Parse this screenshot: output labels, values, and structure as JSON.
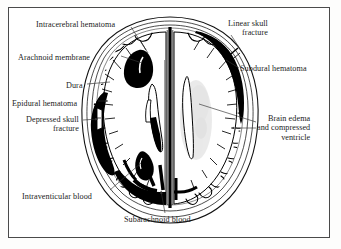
{
  "figure": {
    "frame_color": "#4a4a4a",
    "background_color": "#ffffff",
    "ink_color": "#000000",
    "text_color": "#232323",
    "edema_color": "#cfcfcf"
  },
  "labels": [
    {
      "id": "intracerebral-hematoma",
      "text": "Intracerebral hematoma",
      "align": "left",
      "x": 36,
      "y": 20
    },
    {
      "id": "arachnoid-membrane",
      "text": "Arachnoid membrane",
      "align": "left",
      "x": 18,
      "y": 53
    },
    {
      "id": "dura",
      "text": "Dura",
      "align": "left",
      "x": 66,
      "y": 81
    },
    {
      "id": "epidural-hematoma",
      "text": "Epidural hematoma",
      "align": "left",
      "x": 12,
      "y": 99
    },
    {
      "id": "depressed-skull-fracture",
      "text": "Depressed skull\nfracture",
      "align": "left",
      "x": 26,
      "y": 117
    },
    {
      "id": "intraventicular-blood",
      "text": "Intraventicular blood",
      "align": "left",
      "x": 22,
      "y": 192
    },
    {
      "id": "subarachnoid-blood",
      "text": "Subarachnoid blood",
      "align": "left",
      "x": 124,
      "y": 215
    },
    {
      "id": "linear-skull-fracture",
      "text": "Linear skull\nfracture",
      "align": "left",
      "x": 228,
      "y": 20
    },
    {
      "id": "subdural-hematoma",
      "text": "Subdural hematoma",
      "align": "left",
      "x": 240,
      "y": 65
    },
    {
      "id": "brain-edema",
      "text": "Brain edema\nand compressed\nventricle",
      "align": "left",
      "x": 257,
      "y": 116
    }
  ],
  "anatomy": {
    "structures": [
      "skull-outer-table",
      "skull-inner-table",
      "dura-mater",
      "arachnoid-membrane",
      "cerebral-cortex-left",
      "cerebral-cortex-right",
      "falx-cerebri",
      "lateral-ventricle-left",
      "lateral-ventricle-right"
    ],
    "lesions": [
      "intracerebral-hematoma",
      "epidural-hematoma",
      "subdural-hematoma",
      "subarachnoid-blood",
      "intraventricular-blood",
      "depressed-skull-fracture",
      "linear-skull-fracture",
      "brain-edema"
    ]
  }
}
